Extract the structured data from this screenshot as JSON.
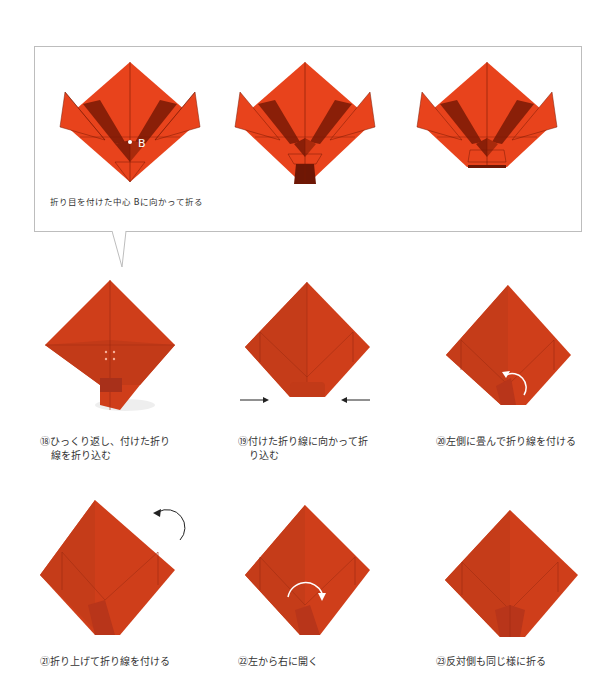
{
  "colors": {
    "paper": "#e8431c",
    "paper_dark": "#8a1f08",
    "paper_photo": "#cf3e1a",
    "paper_photo_shade": "#b5341a",
    "crease": "#7a1a05",
    "callout_border": "#bdbdbd",
    "text": "#333333",
    "arrow": "#222222"
  },
  "callout": {
    "caption": "折り目を付けた中心 Bに向かって折る",
    "point_label": "B",
    "diagrams": [
      {
        "name": "fold-toward-b-1"
      },
      {
        "name": "fold-toward-b-2"
      },
      {
        "name": "fold-toward-b-3"
      }
    ]
  },
  "steps": [
    {
      "number": "⑱",
      "line1": "ひっくり返し、付けた折り",
      "line2": "線を折り込む"
    },
    {
      "number": "⑲",
      "line1": "付けた折り線に向かって折",
      "line2": "り込む"
    },
    {
      "number": "⑳",
      "line1": "左側に畳んで折り線を付ける",
      "line2": ""
    },
    {
      "number": "㉑",
      "line1": "折り上げて折り線を付ける",
      "line2": ""
    },
    {
      "number": "㉒",
      "line1": "左から右に開く",
      "line2": ""
    },
    {
      "number": "㉓",
      "line1": "反対側も同じ様に折る",
      "line2": ""
    }
  ]
}
